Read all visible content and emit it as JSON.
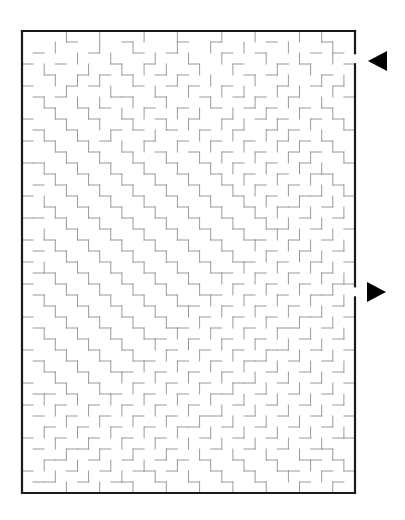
{
  "page": {
    "background_color": "#ffffff",
    "width": 405,
    "height": 520
  },
  "maze": {
    "title": "",
    "type": "rectangular-perfect-maze",
    "grid": {
      "cols": 30,
      "rows": 42
    },
    "geometry": {
      "x": 22,
      "y": 31,
      "width": 333,
      "height": 462,
      "cell_size": 11.1
    },
    "colors": {
      "border": "#1a1a1a",
      "wall": "#8f8f8f",
      "background": "#ffffff",
      "arrow": "#000000"
    },
    "stroke": {
      "border_width": 2.2,
      "wall_width": 0.9
    },
    "entrance": {
      "name": "entrance",
      "side": "right",
      "row": 2,
      "gap_y_start": 53.2,
      "gap_y_end": 64.3
    },
    "exit": {
      "name": "exit",
      "side": "right",
      "row": 23,
      "gap_y_start": 286.3,
      "gap_y_end": 297.4
    },
    "markers": [
      {
        "name": "entrance-arrow",
        "direction": "left",
        "points": "387,51 387,71 368,61",
        "color": "#000000"
      },
      {
        "name": "exit-arrow",
        "direction": "right",
        "points": "367,282 367,302 386,292",
        "color": "#000000"
      }
    ],
    "walls": {
      "horizontal_note": "h[r][c]=1 means wall on top edge of cell (r,c); rows 0..42, cols 0..29",
      "vertical_note": "v[r][c]=1 means wall on left edge of cell (r,c); rows 0..41, cols 0..30",
      "h": [
        "111111111111111111111111111111",
        "000010000100001001000010000100",
        "010000100010010000100100001010",
        "100100001001000100010001010001",
        "001001010100101000001010000100",
        "100010100010010100100001001010",
        "010100001100100010010100100001",
        "001001010001001001001010010100",
        "100100100100100100100101001010",
        "010010001010010010010010100001",
        "101001010001001001001001010100",
        "000100100100100100100100101010",
        "110010010010010010010010010001",
        "001001001001001001001001001100",
        "010100100100100100100100100010",
        "100010010010010010010010011001",
        "001001001001001001001001100100",
        "110100100100100100100100010010",
        "000010010010010010010011001001",
        "101001001001001001001100100100",
        "010100100100100100100010010010",
        "100010010010010010011001001001",
        "011001001001001001100100100100",
        "100100100100100100010010010011",
        "010010010010010011001001001100",
        "001001001001001100100100100010",
        "100100100100100010010010011001",
        "010010010010011001001001100100",
        "001001001001100100100100010010",
        "100100100100010010010011001001",
        "010010010011001001001100100100",
        "001001001100100100100010010010",
        "100100100010010010011001001001",
        "011010011001001001100100100100",
        "100100100100100100010010010010",
        "010010010010010011001001001001",
        "001001001001001100100100100100",
        "100100100100100010010010010011",
        "010011010010010001001001001100",
        "001100100100101010010010011010",
        "100010010011010001001001100101",
        "011001001100100100100100010010",
        "111111111111111111111111111111"
      ],
      "v": [
        "1000100100010010001001000101001",
        "1001000100100010010010001000101",
        "1000010010001001001000100100101",
        "1010001001010100100100010010001",
        "1001010100100010010001001001011",
        "1000100010001001001010010100101",
        "1010010100100100010001001001001",
        "1001001001010010100100100100101",
        "1000100100100101001010010010011",
        "1010010010001000100100101001001",
        "1001001001010010010010010100101",
        "1000100100100100101001001010011",
        "1010010010010010010100100101001",
        "1001001001001001001010010010101",
        "1000100100100100100101001001011",
        "1010010010010010010010100100101",
        "1001001001001001001001010010011",
        "1000100100100100100100101001001",
        "1010010010010010010010010100101",
        "1001001001001001001001001010011",
        "1000100100100100100100100101001",
        "1010010010010010010010010010101",
        "1001001001001001001001001001011",
        "1000100100100100100100100100101",
        "1010010010010010010010010010011",
        "1001001001001001001001001001001",
        "1000100100100100100100100100101",
        "1010010010010010010010010010011",
        "1001001001001001001001001001001",
        "1000100100100100100100100100101",
        "1010010010010010010010010010011",
        "1001001001001001001001001001001",
        "1000100100100100100100100100101",
        "1010010010010010010010010010011",
        "1001001001001001001001001001001",
        "1000100100100100100100100100101",
        "1010010010010010010010010010011",
        "1001001001001001001001001001001",
        "1000100100100100100100100100101",
        "1010010010010010010010010010011",
        "1001001001001001001001001001001",
        "1000100100100100100100100100101"
      ]
    }
  }
}
